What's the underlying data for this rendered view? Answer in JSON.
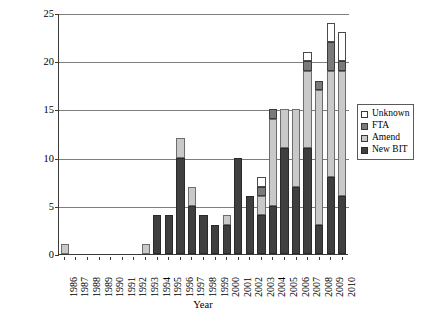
{
  "chart_data": {
    "type": "bar",
    "stacked": true,
    "title": "",
    "xlabel": "Year",
    "ylabel": "Number of Renegotiated BITs",
    "ylim": [
      0,
      25
    ],
    "yticks": [
      0,
      5,
      10,
      15,
      20,
      25
    ],
    "grid": true,
    "legend_position": "right",
    "categories": [
      "1986",
      "1987",
      "1988",
      "1989",
      "1990",
      "1991",
      "1992",
      "1993",
      "1994",
      "1995",
      "1996",
      "1997",
      "1998",
      "1999",
      "2000",
      "2001",
      "2002",
      "2003",
      "2004",
      "2005",
      "2006",
      "2007",
      "2008",
      "2009",
      "2010"
    ],
    "series": [
      {
        "name": "New BIT",
        "color": "#3f3f3f",
        "values": [
          0,
          0,
          0,
          0,
          0,
          0,
          0,
          0,
          4,
          4,
          10,
          5,
          4,
          3,
          3,
          10,
          6,
          4,
          5,
          11,
          7,
          11,
          3,
          8,
          6
        ]
      },
      {
        "name": "Amend",
        "color": "#c9c9c9",
        "values": [
          1,
          0,
          0,
          0,
          0,
          0,
          0,
          1,
          0,
          0,
          2,
          2,
          0,
          0,
          1,
          0,
          0,
          2,
          9,
          4,
          8,
          8,
          14,
          11,
          13
        ]
      },
      {
        "name": "FTA",
        "color": "#7a7a7a",
        "values": [
          0,
          0,
          0,
          0,
          0,
          0,
          0,
          0,
          0,
          0,
          0,
          0,
          0,
          0,
          0,
          0,
          0,
          1,
          1,
          0,
          0,
          1,
          1,
          3,
          1
        ]
      },
      {
        "name": "Unknown",
        "color": "#ffffff",
        "values": [
          0,
          0,
          0,
          0,
          0,
          0,
          0,
          0,
          0,
          0,
          0,
          0,
          0,
          0,
          0,
          0,
          0,
          1,
          0,
          0,
          0,
          1,
          0,
          2,
          3
        ]
      }
    ],
    "totals": [
      1,
      0,
      0,
      0,
      0,
      0,
      0,
      1,
      4,
      4,
      12,
      7,
      4,
      3,
      4,
      10,
      6,
      8,
      15,
      15,
      15,
      21,
      18,
      24,
      23
    ]
  },
  "legend": {
    "items": [
      {
        "label": "Unknown",
        "key": "unknown"
      },
      {
        "label": "FTA",
        "key": "fta"
      },
      {
        "label": "Amend",
        "key": "amend"
      },
      {
        "label": "New BIT",
        "key": "newbit"
      }
    ]
  }
}
